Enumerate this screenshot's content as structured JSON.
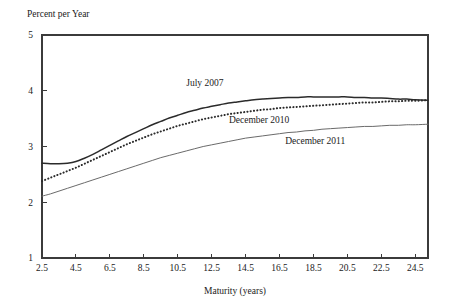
{
  "chart_data": {
    "type": "line",
    "title": "",
    "xlabel": "Maturity (years)",
    "ylabel": "Percent per Year",
    "xlim": [
      2.5,
      25.25
    ],
    "ylim": [
      1,
      5
    ],
    "grid": false,
    "legend_position": "inline-annotations",
    "xticks": [
      "2.5",
      "4.5",
      "6.5",
      "8.5",
      "10.5",
      "12.5",
      "14.5",
      "16.5",
      "18.5",
      "20.5",
      "22.5",
      "24.5"
    ],
    "xtick_values": [
      2.5,
      4.5,
      6.5,
      8.5,
      10.5,
      12.5,
      14.5,
      16.5,
      18.5,
      20.5,
      22.5,
      24.5
    ],
    "yticks": [
      "1",
      "2",
      "3",
      "4",
      "5"
    ],
    "ytick_values": [
      1,
      2,
      3,
      4,
      5
    ],
    "x": [
      2.5,
      3.0,
      3.5,
      4.0,
      4.5,
      5.0,
      5.5,
      6.0,
      6.5,
      7.0,
      7.5,
      8.0,
      8.5,
      9.0,
      9.5,
      10.0,
      10.5,
      11.0,
      11.5,
      12.0,
      12.5,
      13.0,
      13.5,
      14.0,
      14.5,
      15.0,
      15.5,
      16.0,
      16.5,
      17.0,
      17.5,
      18.0,
      18.5,
      19.0,
      19.5,
      20.0,
      20.5,
      21.0,
      21.5,
      22.0,
      22.5,
      23.0,
      23.5,
      24.0,
      24.5,
      25.25
    ],
    "series": [
      {
        "name": "July 2007",
        "style": "solid",
        "color": "#2b2b2b",
        "width": 1.5,
        "label_x": 12.1,
        "label_y": 4.08,
        "values": [
          2.7,
          2.69,
          2.69,
          2.7,
          2.73,
          2.79,
          2.86,
          2.94,
          3.02,
          3.1,
          3.18,
          3.25,
          3.32,
          3.39,
          3.45,
          3.51,
          3.56,
          3.61,
          3.65,
          3.69,
          3.72,
          3.75,
          3.78,
          3.8,
          3.82,
          3.84,
          3.85,
          3.86,
          3.87,
          3.88,
          3.88,
          3.89,
          3.89,
          3.89,
          3.89,
          3.89,
          3.89,
          3.88,
          3.88,
          3.87,
          3.87,
          3.86,
          3.85,
          3.85,
          3.84,
          3.83
        ]
      },
      {
        "name": "December 2010",
        "style": "dotted",
        "color": "#2b2b2b",
        "width": 2.0,
        "label_x": 15.3,
        "label_y": 3.43,
        "values": [
          2.38,
          2.44,
          2.5,
          2.56,
          2.62,
          2.69,
          2.76,
          2.83,
          2.9,
          2.97,
          3.04,
          3.1,
          3.16,
          3.22,
          3.27,
          3.32,
          3.37,
          3.41,
          3.45,
          3.49,
          3.52,
          3.55,
          3.58,
          3.6,
          3.62,
          3.64,
          3.66,
          3.67,
          3.69,
          3.7,
          3.71,
          3.72,
          3.73,
          3.74,
          3.75,
          3.76,
          3.77,
          3.78,
          3.79,
          3.79,
          3.8,
          3.81,
          3.81,
          3.82,
          3.82,
          3.83
        ]
      },
      {
        "name": "December 2011",
        "style": "solid",
        "color": "#6a6a6a",
        "width": 1.0,
        "label_x": 18.6,
        "label_y": 3.05,
        "values": [
          2.11,
          2.15,
          2.2,
          2.25,
          2.3,
          2.35,
          2.4,
          2.45,
          2.5,
          2.55,
          2.6,
          2.65,
          2.7,
          2.75,
          2.8,
          2.84,
          2.88,
          2.92,
          2.96,
          3.0,
          3.03,
          3.06,
          3.09,
          3.12,
          3.15,
          3.17,
          3.19,
          3.21,
          3.23,
          3.25,
          3.26,
          3.28,
          3.29,
          3.31,
          3.32,
          3.33,
          3.34,
          3.35,
          3.36,
          3.36,
          3.37,
          3.38,
          3.38,
          3.39,
          3.39,
          3.4
        ]
      }
    ]
  },
  "plot_geometry": {
    "left": 42,
    "right": 428,
    "top": 35,
    "bottom": 258
  }
}
